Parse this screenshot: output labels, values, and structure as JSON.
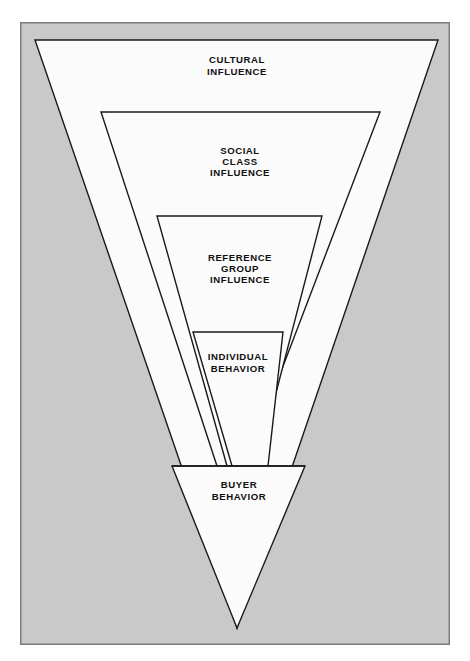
{
  "figure": {
    "title_visible": false,
    "background_color": "#ffffff",
    "frame": {
      "fill_color": "#c9c9c9",
      "border_color": "#7d7d7d",
      "border_width": 1.5,
      "x": 20,
      "y": 22,
      "width": 430,
      "height": 623
    },
    "shape_style": {
      "fill_color": "#fbfbfb",
      "stroke_color": "#1a1a1a",
      "stroke_width": 1.4
    }
  },
  "chart_data": {
    "type": "diagram",
    "subtype": "nested-inverted-triangle-funnel",
    "title": "",
    "levels": [
      {
        "index": 0,
        "label": "CULTURAL\nINFLUENCE",
        "label_lines": [
          "CULTURAL",
          "INFLUENCE"
        ],
        "scope": "broadest",
        "shape": "triangle",
        "points": "35,40 438,40 237,628",
        "label_x": 237,
        "label_y": 66
      },
      {
        "index": 1,
        "label": "SOCIAL\nCLASS\nINFLUENCE",
        "label_lines": [
          "SOCIAL",
          "CLASS",
          "INFLUENCE"
        ],
        "scope": "second",
        "shape": "trapezoid",
        "points": "101,112 380,112 245,466 217,466",
        "label_x": 240,
        "label_y": 162
      },
      {
        "index": 2,
        "label": "REFERENCE\nGROUP\nINFLUENCE",
        "label_lines": [
          "REFERENCE",
          "GROUP",
          "INFLUENCE"
        ],
        "scope": "third",
        "shape": "trapezoid",
        "points": "157,216 322,216 257,466 227,466",
        "label_x": 240,
        "label_y": 269
      },
      {
        "index": 3,
        "label": "INDIVIDUAL\nBEHAVIOR",
        "label_lines": [
          "INDIVIDUAL",
          "BEHAVIOR"
        ],
        "scope": "innermost",
        "shape": "trapezoid",
        "points": "193,332 283,332 268,466 232,466",
        "label_x": 238,
        "label_y": 363
      },
      {
        "index": 4,
        "label": "BUYER\nBEHAVIOR",
        "label_lines": [
          "BUYER",
          "BEHAVIOR"
        ],
        "scope": "outcome",
        "shape": "triangle-tip",
        "points": "172,466 305,466 237,628",
        "label_x": 239,
        "label_y": 491
      }
    ],
    "divider_line": {
      "description": "horizontal line separating funnel levels from buyer behavior tip",
      "x1": 172,
      "y1": 466,
      "x2": 305,
      "y2": 466
    },
    "reading_direction": "outer (broad social influences) narrowing inward/downward to buyer behavior"
  }
}
